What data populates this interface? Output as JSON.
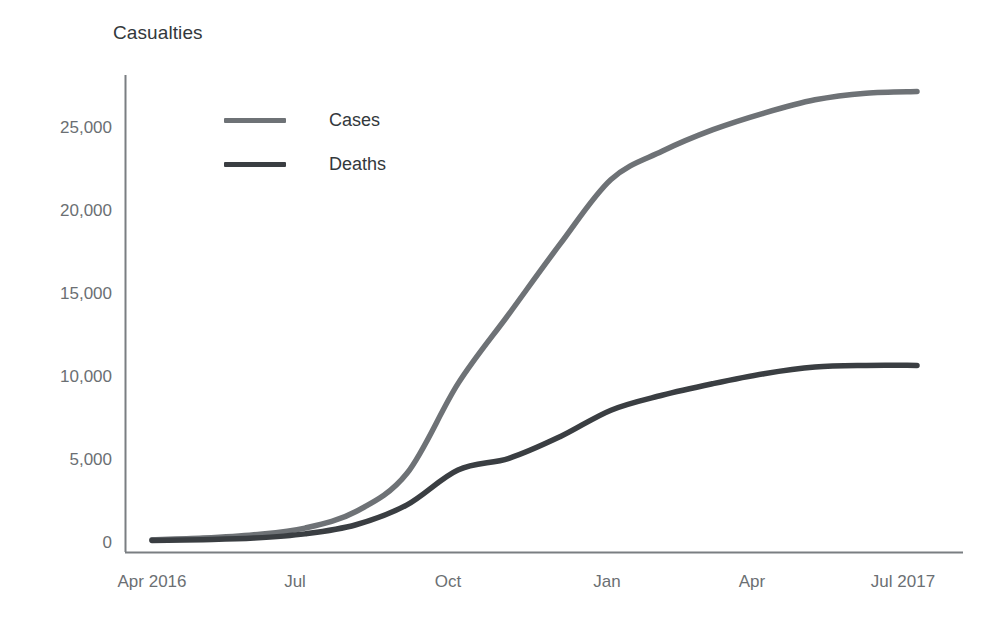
{
  "chart_data": {
    "type": "line",
    "title": "Casualties",
    "xlabel": "",
    "ylabel": "Casualties",
    "ylim": [
      0,
      28000
    ],
    "yticks": [
      0,
      5000,
      10000,
      15000,
      20000,
      25000
    ],
    "ytick_labels": [
      "0",
      "5,000",
      "10,000",
      "15,000",
      "20,000",
      "25,000"
    ],
    "xticks": [
      "Apr 2016",
      "Jul",
      "Oct",
      "Jan",
      "Apr",
      "Jul 2017"
    ],
    "xtick_labels": [
      "Apr 2016",
      "Jul",
      "Oct",
      "Jan",
      "Apr",
      "Jul 2017"
    ],
    "x_range": [
      "Apr 2016",
      "Jul 2017"
    ],
    "grid": false,
    "legend_position": "upper left inside",
    "x": [
      "Apr 2016",
      "May 2016",
      "Jun 2016",
      "Jul 2016",
      "Aug 2016",
      "Sep 2016",
      "Oct 2016",
      "Nov 2016",
      "Dec 2016",
      "Jan 2017",
      "Feb 2017",
      "Mar 2017",
      "Apr 2017",
      "May 2017",
      "Jun 2017",
      "Jul 2017"
    ],
    "series": [
      {
        "name": "Cases",
        "color": "#6e7276",
        "values": [
          200,
          300,
          500,
          900,
          1900,
          4200,
          9600,
          13800,
          18000,
          21900,
          23600,
          24900,
          25900,
          26700,
          27100,
          27200
        ]
      },
      {
        "name": "Deaths",
        "color": "#3a3e42",
        "values": [
          150,
          200,
          300,
          550,
          1100,
          2300,
          4400,
          5100,
          6400,
          8000,
          8900,
          9600,
          10200,
          10600,
          10700,
          10700
        ]
      }
    ]
  },
  "legend": {
    "items": [
      {
        "label": "Cases",
        "color": "#6e7276"
      },
      {
        "label": "Deaths",
        "color": "#3a3e42"
      }
    ]
  },
  "axis": {
    "line_color": "#7a7e82"
  }
}
